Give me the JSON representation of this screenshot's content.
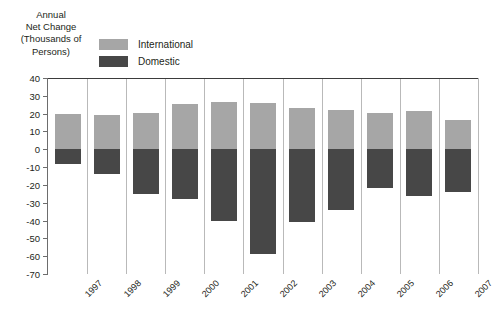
{
  "title_lines": [
    "Annual",
    "Net Change",
    "(Thousands of",
    "Persons)"
  ],
  "legend": [
    {
      "label": "International",
      "color": "#a6a6a6",
      "swatch_name": "legend-swatch-international"
    },
    {
      "label": "Domestic",
      "color": "#474747",
      "swatch_name": "legend-swatch-domestic"
    }
  ],
  "colors": {
    "international": "#a6a6a6",
    "domestic": "#474747",
    "gridline": "#b9b9b9",
    "axis": "#6d6d6d",
    "zero_line": "#3b3b3b",
    "text": "#231f20",
    "background": "#ffffff"
  },
  "chart_data": {
    "type": "bar",
    "title": "Annual Net Change (Thousands of Persons)",
    "xlabel": "",
    "ylabel": "Annual Net Change (Thousands of Persons)",
    "ylim": [
      -70,
      40
    ],
    "ytick_step": 10,
    "yticks": [
      40,
      30,
      20,
      10,
      0,
      -10,
      -20,
      -30,
      -40,
      -50,
      -60,
      -70
    ],
    "ytick_labels": [
      "40",
      "30",
      "20",
      "10",
      "0",
      "-10",
      "-20",
      "-30",
      "-40",
      "-50",
      "-60",
      "-70"
    ],
    "grid": "vertical-separators",
    "legend_position": "top-left",
    "stacked": false,
    "categories": [
      "1997",
      "1998",
      "1999",
      "2000",
      "2001",
      "2002",
      "2003",
      "2004",
      "2005",
      "2006",
      "2007"
    ],
    "series": [
      {
        "name": "International",
        "color": "#a6a6a6",
        "values": [
          20,
          19,
          20.5,
          25.5,
          26.5,
          26,
          23,
          22,
          20.5,
          21.5,
          16.5
        ]
      },
      {
        "name": "Domestic",
        "color": "#474747",
        "values": [
          -8,
          -14,
          -25,
          -28,
          -40.5,
          -59,
          -41,
          -34,
          -22,
          -26,
          -24
        ]
      }
    ]
  }
}
